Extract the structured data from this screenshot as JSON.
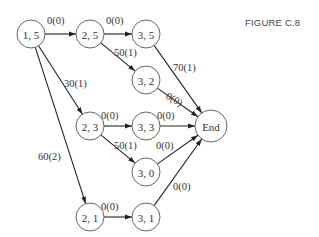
{
  "figure": {
    "title": "FIGURE C.8"
  },
  "nodes": [
    {
      "id": "n15",
      "label": "1, 5",
      "x": 31,
      "y": 34
    },
    {
      "id": "n25",
      "label": "2, 5",
      "x": 90,
      "y": 34
    },
    {
      "id": "n35",
      "label": "3, 5",
      "x": 146,
      "y": 34
    },
    {
      "id": "n32",
      "label": "3, 2",
      "x": 146,
      "y": 80
    },
    {
      "id": "n23",
      "label": "2, 3",
      "x": 90,
      "y": 126
    },
    {
      "id": "n33",
      "label": "3, 3",
      "x": 146,
      "y": 126
    },
    {
      "id": "end",
      "label": "End",
      "x": 211,
      "y": 126
    },
    {
      "id": "n30",
      "label": "3, 0",
      "x": 146,
      "y": 172
    },
    {
      "id": "n21",
      "label": "2, 1",
      "x": 90,
      "y": 217
    },
    {
      "id": "n31",
      "label": "3, 1",
      "x": 146,
      "y": 217
    }
  ],
  "edges": [
    {
      "from": "n15",
      "to": "n25",
      "label": "0(0)",
      "lx": 47,
      "ly": 24
    },
    {
      "from": "n25",
      "to": "n35",
      "label": "0(0)",
      "lx": 106,
      "ly": 24
    },
    {
      "from": "n25",
      "to": "n32",
      "label": "50(1)",
      "lx": 114,
      "ly": 56
    },
    {
      "from": "n15",
      "to": "n23",
      "label": "30(1)",
      "lx": 64,
      "ly": 87
    },
    {
      "from": "n15",
      "to": "n21",
      "label": "60(2)",
      "lx": 38,
      "ly": 160
    },
    {
      "from": "n35",
      "to": "end",
      "label": "70(1)",
      "lx": 173,
      "ly": 71
    },
    {
      "from": "n32",
      "to": "end",
      "label": "0(0)",
      "lx": 165,
      "ly": 98,
      "rotate": 30
    },
    {
      "from": "n23",
      "to": "n33",
      "label": "0(0)",
      "lx": 101,
      "ly": 119
    },
    {
      "from": "n33",
      "to": "end",
      "label": "0(0)",
      "lx": 157,
      "ly": 119
    },
    {
      "from": "n23",
      "to": "n30",
      "label": "50(1)",
      "lx": 114,
      "ly": 149
    },
    {
      "from": "n30",
      "to": "end",
      "label": "0(0)",
      "lx": 156,
      "ly": 149
    },
    {
      "from": "n21",
      "to": "n31",
      "label": "0(0)",
      "lx": 101,
      "ly": 210
    },
    {
      "from": "n31",
      "to": "end",
      "label": "0(0)",
      "lx": 173,
      "ly": 190
    }
  ]
}
